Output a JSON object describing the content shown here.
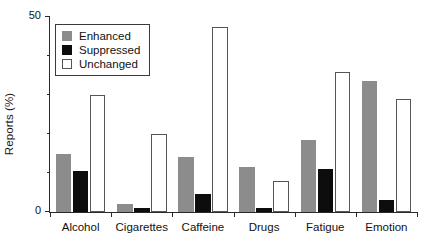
{
  "chart_data": {
    "type": "bar",
    "title": "",
    "xlabel": "",
    "ylabel": "Reports (%)",
    "ylim": [
      0,
      50
    ],
    "yticks": [
      0,
      50
    ],
    "ytick_labels": [
      "0",
      "50"
    ],
    "yminor_ticks": [
      10,
      20,
      30,
      40
    ],
    "grid": false,
    "legend_position": "upper-left-inside",
    "categories": [
      "Alcohol",
      "Cigarettes",
      "Caffeine",
      "Drugs",
      "Fatigue",
      "Emotion"
    ],
    "series": [
      {
        "name": "Enhanced",
        "color": "#8c8c8c",
        "values": [
          15.0,
          2.0,
          14.0,
          11.5,
          18.5,
          33.5
        ]
      },
      {
        "name": "Suppressed",
        "color": "#0d0d0d",
        "values": [
          10.5,
          1.0,
          4.5,
          1.0,
          11.0,
          3.0
        ]
      },
      {
        "name": "Unchanged",
        "color": "#ffffff",
        "values": [
          30.0,
          20.0,
          47.5,
          8.0,
          36.0,
          29.0
        ]
      }
    ]
  },
  "legend": {
    "items": [
      {
        "label": "Enhanced",
        "swatch": "enhanced"
      },
      {
        "label": "Suppressed",
        "swatch": "suppressed"
      },
      {
        "label": "Unchanged",
        "swatch": "unchanged"
      }
    ]
  }
}
